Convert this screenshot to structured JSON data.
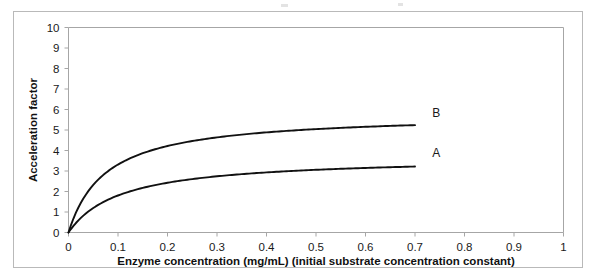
{
  "chart_data": {
    "type": "line",
    "title": "",
    "xlabel": "Enzyme concentration (mg/mL)  (initial substrate concentration constant)",
    "ylabel": "Acceleration factor",
    "xlim": [
      0,
      1
    ],
    "ylim": [
      0,
      10
    ],
    "xticks": [
      "0",
      "0.1",
      "0.2",
      "0.3",
      "0.4",
      "0.5",
      "0.6",
      "0.7",
      "0.8",
      "0.9",
      "1"
    ],
    "xtick_values": [
      0,
      0.1,
      0.2,
      0.3,
      0.4,
      0.5,
      0.6,
      0.7,
      0.8,
      0.9,
      1
    ],
    "yticks": [
      "0",
      "1",
      "2",
      "3",
      "4",
      "5",
      "6",
      "7",
      "8",
      "9",
      "10"
    ],
    "ytick_values": [
      0,
      1,
      2,
      3,
      4,
      5,
      6,
      7,
      8,
      9,
      10
    ],
    "grid": false,
    "legend_position": "inline-right-of-curve-ends",
    "series": [
      {
        "name": "B",
        "label": "B",
        "color": "#111111",
        "plateau": 5.8,
        "half_saturation": 0.075,
        "x": [
          0,
          0.01,
          0.02,
          0.03,
          0.04,
          0.05,
          0.06,
          0.07,
          0.08,
          0.09,
          0.1,
          0.12,
          0.14,
          0.16,
          0.18,
          0.2,
          0.24,
          0.28,
          0.32,
          0.36,
          0.4,
          0.45,
          0.5,
          0.55,
          0.6,
          0.65,
          0.7
        ],
        "values": [
          0,
          0.68,
          1.22,
          1.65,
          2.02,
          2.32,
          2.58,
          2.8,
          3.0,
          3.17,
          3.31,
          3.57,
          3.77,
          3.94,
          4.08,
          4.21,
          4.42,
          4.58,
          4.71,
          4.82,
          4.91,
          5.0,
          5.08,
          5.14,
          5.2,
          5.24,
          5.28
        ]
      },
      {
        "name": "A",
        "label": "A",
        "color": "#111111",
        "plateau": 3.7,
        "half_saturation": 0.105,
        "x": [
          0,
          0.01,
          0.02,
          0.03,
          0.04,
          0.05,
          0.06,
          0.07,
          0.08,
          0.09,
          0.1,
          0.12,
          0.14,
          0.16,
          0.18,
          0.2,
          0.24,
          0.28,
          0.32,
          0.36,
          0.4,
          0.45,
          0.5,
          0.55,
          0.6,
          0.65,
          0.7
        ],
        "values": [
          0,
          0.36,
          0.68,
          0.96,
          1.21,
          1.43,
          1.62,
          1.8,
          1.96,
          2.1,
          2.23,
          2.46,
          2.64,
          2.8,
          2.93,
          3.04,
          3.22,
          3.36,
          3.46,
          3.54,
          3.6,
          3.66,
          3.7,
          3.74,
          3.76,
          3.78,
          3.8
        ]
      }
    ],
    "annotations": [
      {
        "text": "B",
        "x": 0.735,
        "y": 5.85
      },
      {
        "text": "A",
        "x": 0.735,
        "y": 3.9
      }
    ]
  },
  "axes": {
    "y_title": "Acceleration factor",
    "x_title": "Enzyme concentration (mg/mL)  (initial substrate concentration constant)"
  }
}
